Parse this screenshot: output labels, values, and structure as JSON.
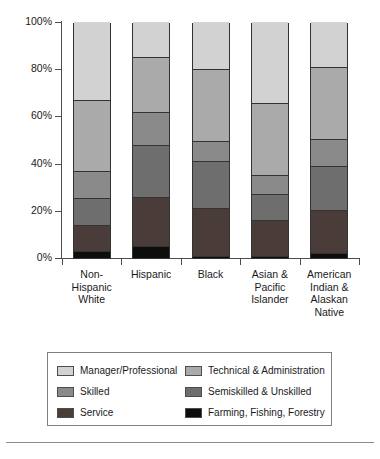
{
  "chart_data": {
    "type": "bar",
    "subtype": "stacked-bar-100-percent",
    "title": "",
    "xlabel": "",
    "ylabel": "",
    "ylim": [
      0,
      100
    ],
    "yticks": [
      0,
      20,
      40,
      60,
      80,
      100
    ],
    "ytick_labels": [
      "0%",
      "20%",
      "40%",
      "60%",
      "80%",
      "100%"
    ],
    "grid": false,
    "legend_position": "bottom",
    "stack_order_bottom_to_top": [
      "Farming, Fishing, Forestry",
      "Service",
      "Semiskilled & Unskilled",
      "Skilled",
      "Technical & Administration",
      "Manager/Professional"
    ],
    "categories": [
      "Non-Hispanic White",
      "Hispanic",
      "Black",
      "Asian & Pacific Islander",
      "American Indian & Alaskan Native"
    ],
    "category_label_lines": [
      [
        "Non-",
        "Hispanic",
        "White"
      ],
      [
        "Hispanic"
      ],
      [
        "Black"
      ],
      [
        "Asian &",
        "Pacific",
        "Islander"
      ],
      [
        "American",
        "Indian &",
        "Alaskan",
        "Native"
      ]
    ],
    "series": [
      {
        "name": "Farming, Fishing, Forestry",
        "color": "#0d0d0d",
        "values": [
          3,
          5,
          1,
          1,
          2
        ]
      },
      {
        "name": "Service",
        "color": "#4a3c38",
        "values": [
          11,
          21,
          20,
          15,
          18.5
        ]
      },
      {
        "name": "Semiskilled & Unskilled",
        "color": "#6e6e6e",
        "values": [
          11.5,
          22,
          20,
          11,
          18.5
        ]
      },
      {
        "name": "Skilled",
        "color": "#8a8a8a",
        "values": [
          11.5,
          14,
          8.5,
          8,
          11.5
        ]
      },
      {
        "name": "Technical & Administration",
        "color": "#aaaaaa",
        "values": [
          30,
          23,
          30.5,
          30.5,
          30.5
        ]
      },
      {
        "name": "Manager/Professional",
        "color": "#d2d2d2",
        "values": [
          33,
          15,
          20,
          34.5,
          19
        ]
      }
    ],
    "cumulative_boundaries": {
      "Non-Hispanic White": [
        3,
        14,
        25.5,
        37,
        67,
        100
      ],
      "Hispanic": [
        5,
        26,
        48,
        62,
        85,
        100
      ],
      "Black": [
        1,
        21,
        41,
        49.5,
        80,
        100
      ],
      "Asian & Pacific Islander": [
        1,
        16,
        27,
        35,
        65.5,
        100
      ],
      "American Indian & Alaskan Native": [
        2,
        20.5,
        39,
        50.5,
        81,
        100
      ]
    }
  },
  "legend": {
    "items": [
      {
        "label": "Manager/Professional",
        "color": "#d2d2d2"
      },
      {
        "label": "Technical & Administration",
        "color": "#aaaaaa"
      },
      {
        "label": "Skilled",
        "color": "#8a8a8a"
      },
      {
        "label": "Semiskilled & Unskilled",
        "color": "#6e6e6e"
      },
      {
        "label": "Service",
        "color": "#4a3c38"
      },
      {
        "label": "Farming, Fishing, Forestry",
        "color": "#0d0d0d"
      }
    ]
  }
}
